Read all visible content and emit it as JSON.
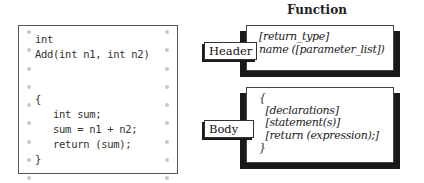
{
  "code_panel": {
    "lines": [
      "int",
      "Add(int n1, int n2)",
      "",
      "",
      "{",
      "   int sum;",
      "   sum = n1 + n2;",
      "   return (sum);",
      "}"
    ],
    "code_text": "int\nAdd(int n1, int n2)\n\n\n{\n   int sum;\n   sum = n1 + n2;\n   return (sum);\n}"
  },
  "diagram": {
    "title": "Function",
    "header": {
      "label": "Header",
      "content": "[return_type]\nname ([parameter_list])"
    },
    "body": {
      "label": "Body",
      "content": "{\n  [declarations]\n  [statement(s)]\n  [return (expression);]\n}"
    }
  }
}
